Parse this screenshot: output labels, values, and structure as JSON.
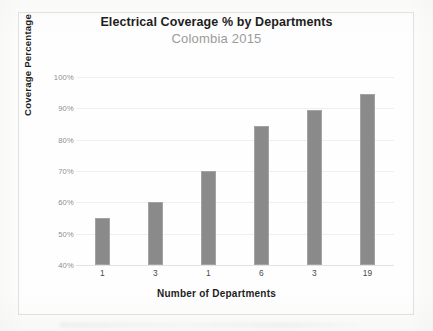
{
  "chart_data": {
    "type": "bar",
    "title": "Electrical Coverage % by Departments",
    "subtitle": "Colombia 2015",
    "xlabel": "Number of Departments",
    "ylabel": "Coverage Percentage",
    "categories": [
      "1",
      "3",
      "1",
      "6",
      "3",
      "19"
    ],
    "values": [
      55,
      60,
      70,
      84.5,
      89.5,
      94.5
    ],
    "ylim": [
      40,
      100
    ],
    "yticks": [
      "100%",
      "90%",
      "80%",
      "70%",
      "60%",
      "50%",
      "40%"
    ],
    "ytick_values": [
      100,
      90,
      80,
      70,
      60,
      50,
      40
    ],
    "grid": true,
    "legend": "none",
    "series": [
      {
        "name": "Coverage Percentage",
        "values": [
          55,
          60,
          70,
          84.5,
          89.5,
          94.5
        ]
      }
    ],
    "colors": {
      "bar": "#8a8a8a",
      "bar_border": "#a3a3a3",
      "title": "#1d1d1d",
      "subtitle": "#9b9b9b",
      "tick": "#8e8e8e",
      "grid": "#efefee",
      "background": "#fefefe",
      "figure_border": "#e3e3e1"
    }
  }
}
